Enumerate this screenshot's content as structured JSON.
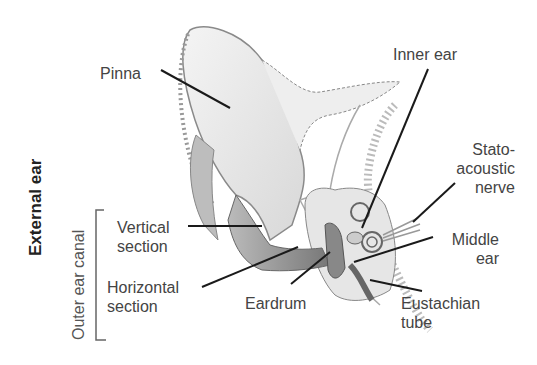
{
  "diagram": {
    "group_labels": {
      "external_ear": "External ear",
      "outer_ear_canal": "Outer ear canal"
    },
    "labels": {
      "pinna": "Pinna",
      "inner_ear": "Inner ear",
      "stato_line1": "Stato-",
      "stato_line2": "acoustic",
      "stato_line3": "nerve",
      "vertical_line1": "Vertical",
      "vertical_line2": "section",
      "horizontal_line1": "Horizontal",
      "horizontal_line2": "section",
      "eardrum": "Eardrum",
      "middle_line1": "Middle",
      "middle_line2": "ear",
      "eustachian_line1": "Eustachian",
      "eustachian_line2": "tube"
    },
    "colors": {
      "leader_line": "#1a1a1a",
      "label_text": "#444444",
      "illustration": "#9a9a9a"
    }
  }
}
